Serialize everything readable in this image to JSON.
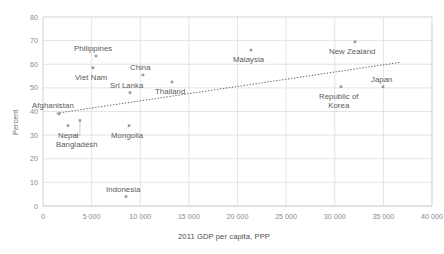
{
  "chart_data": {
    "type": "scatter",
    "title": "",
    "xlabel": "2011 GDP per capita, PPP",
    "ylabel": "Percent",
    "xlim": [
      0,
      40000
    ],
    "ylim": [
      0,
      80
    ],
    "grid": true,
    "legend": "none",
    "xticks": [
      "0",
      "5 000",
      "10 000",
      "15 000",
      "20 000",
      "25 000",
      "30 000",
      "35 000",
      "40 000"
    ],
    "xtick_values": [
      0,
      5000,
      10000,
      15000,
      20000,
      25000,
      30000,
      35000,
      40000
    ],
    "yticks": [
      "0",
      "10",
      "20",
      "30",
      "40",
      "50",
      "60",
      "70",
      "80"
    ],
    "ytick_values": [
      0,
      10,
      20,
      30,
      40,
      50,
      60,
      70,
      80
    ],
    "points": [
      {
        "name": "Afghanistan",
        "x": 1650,
        "y": 39.0,
        "label_dx": -27,
        "label_dy": -13,
        "align": "left",
        "lines": [
          "Afghanistan"
        ]
      },
      {
        "name": "Nepal",
        "x": 2570,
        "y": 34.0,
        "label_dx": -10,
        "label_dy": 5,
        "align": "left",
        "lines": [
          "Nepal"
        ]
      },
      {
        "name": "Bangladesh",
        "x": 3800,
        "y": 36.2,
        "label_dx": -24,
        "label_dy": 20,
        "align": "left",
        "lines": [
          "Bangladesh"
        ]
      },
      {
        "name": "Philippines",
        "x": 5450,
        "y": 63.5,
        "label_dx": -22,
        "label_dy": -12,
        "align": "left",
        "lines": [
          "Philippines"
        ]
      },
      {
        "name": "Viet Nam",
        "x": 5140,
        "y": 58.5,
        "label_dx": -18,
        "label_dy": 5,
        "align": "left",
        "lines": [
          "Viet Nam"
        ]
      },
      {
        "name": "Sri Lanka",
        "x": 8950,
        "y": 48.0,
        "label_dx": -20,
        "label_dy": -12,
        "align": "left",
        "lines": [
          "Sri Lanka"
        ]
      },
      {
        "name": "Mongolia",
        "x": 8850,
        "y": 34.0,
        "label_dx": -18,
        "label_dy": 5,
        "align": "left",
        "lines": [
          "Mongolia"
        ]
      },
      {
        "name": "Indonesia",
        "x": 8540,
        "y": 4.0,
        "label_dx": -20,
        "label_dy": -12,
        "align": "left",
        "lines": [
          "Indonesia"
        ]
      },
      {
        "name": "China",
        "x": 10280,
        "y": 55.5,
        "label_dx": -13,
        "label_dy": -12,
        "align": "left",
        "lines": [
          "China"
        ]
      },
      {
        "name": "Thailand",
        "x": 13270,
        "y": 52.5,
        "label_dx": -17,
        "label_dy": 5,
        "align": "left",
        "lines": [
          "Thailand"
        ]
      },
      {
        "name": "Malaysia",
        "x": 21390,
        "y": 66.0,
        "label_dx": -18,
        "label_dy": 5,
        "align": "left",
        "lines": [
          "Malaysia"
        ]
      },
      {
        "name": "Republic of Korea",
        "x": 30640,
        "y": 50.5,
        "label_dx": -22,
        "label_dy": 5,
        "align": "left",
        "lines": [
          "Republic of",
          "Korea"
        ]
      },
      {
        "name": "New Zealand",
        "x": 32080,
        "y": 69.5,
        "label_dx": -26,
        "label_dy": 5,
        "align": "left",
        "lines": [
          "New Zealand"
        ]
      },
      {
        "name": "Japan",
        "x": 34960,
        "y": 50.5,
        "label_dx": -12,
        "label_dy": -12,
        "align": "left",
        "lines": [
          "Japan"
        ]
      }
    ],
    "trendline": {
      "style": "dotted",
      "x_start": 1440,
      "y_start": 39.3,
      "x_end": 36700,
      "y_end": 60.8
    },
    "leader_lines": [
      {
        "from_point": "Bangladesh",
        "bend_x": 3800,
        "bend_y": 30.0,
        "to_x": 2900,
        "to_y": 30.0
      }
    ],
    "colors": {
      "marker": "#9a9a9a",
      "grid": "#d9d9d9",
      "axis": "#bfbfbf",
      "label_text": "#595959",
      "tick_text": "#8a8a8a",
      "trendline": "#6b6b6b",
      "background": "#ffffff"
    }
  }
}
